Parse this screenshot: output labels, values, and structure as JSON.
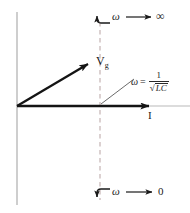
{
  "figure": {
    "background": "#ffffff",
    "width": 190,
    "height": 213
  },
  "colors": {
    "axis": "#b9b9b9",
    "dashed": "#c8b8b8",
    "vector": "#141414",
    "text": "#1a1a1a",
    "leader": "#5a5a5a"
  },
  "labels": {
    "vg": "V",
    "vg_sub": "g",
    "current": "I",
    "omega_top": "ω",
    "arrow_glyph": "⟶",
    "infinity": "∞",
    "omega_bottom": "ω",
    "zero": "0",
    "resonance_omega": "ω",
    "resonance_equals": "=",
    "resonance_numerator": "1",
    "resonance_radical": "√",
    "resonance_denominator": "LC"
  },
  "geometry": {
    "origin": {
      "x": 17,
      "y": 106
    },
    "y_axis": {
      "x": 17,
      "y_top": 12,
      "y_bottom": 205
    },
    "x_axis": {
      "y": 106,
      "x_left": 17,
      "x_right": 190
    },
    "dashed_line": {
      "x": 100,
      "y_top": 22,
      "y_bottom": 200
    },
    "vg_vector": {
      "x1": 17,
      "y1": 106,
      "x2": 93,
      "y2": 61
    },
    "i_vector": {
      "x1": 17,
      "y1": 106,
      "x2": 157,
      "y2": 106
    },
    "leader_line": {
      "x1": 101,
      "y1": 104,
      "x2": 135,
      "y2": 79
    }
  }
}
